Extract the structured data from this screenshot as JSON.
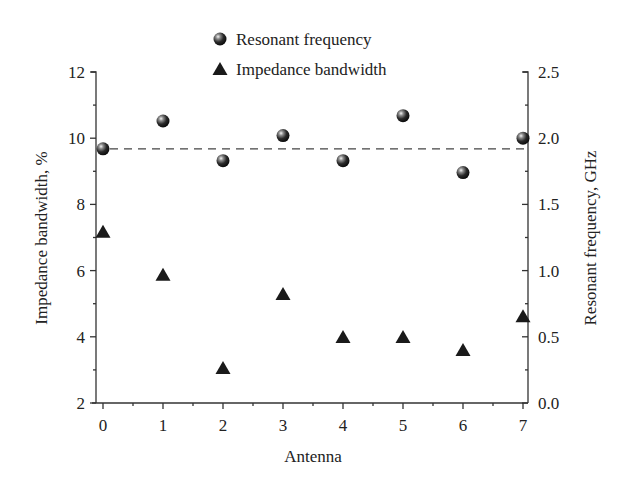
{
  "chart_data": {
    "type": "scatter",
    "title": "",
    "xlabel": "Antenna",
    "ylabel_left": "Impedance bandwidth, %",
    "ylabel_right": "Resonant frequency, GHz",
    "x": [
      0,
      1,
      2,
      3,
      4,
      5,
      6,
      7
    ],
    "xlim": [
      0,
      7
    ],
    "ylim_left": [
      2,
      12
    ],
    "ylim_right": [
      0.0,
      2.5
    ],
    "x_ticks": [
      "0",
      "1",
      "2",
      "3",
      "4",
      "5",
      "6",
      "7"
    ],
    "y_left_ticks": [
      "2",
      "4",
      "6",
      "8",
      "10",
      "12"
    ],
    "y_right_ticks": [
      "0.0",
      "0.5",
      "1.0",
      "1.5",
      "2.0",
      "2.5"
    ],
    "grid": false,
    "legend_position": "top-center",
    "series": [
      {
        "name": "Resonant frequency",
        "marker": "sphere",
        "axis": "right",
        "values": [
          1.92,
          2.13,
          1.83,
          2.02,
          1.83,
          2.17,
          1.74,
          2.0
        ]
      },
      {
        "name": "Impedance bandwidth",
        "marker": "triangle",
        "axis": "left",
        "values": [
          7.15,
          5.85,
          3.03,
          5.27,
          3.97,
          3.97,
          3.58,
          4.6
        ]
      }
    ],
    "reference_lines": [
      {
        "style": "dashed",
        "axis": "right",
        "value": 1.92,
        "label": ""
      }
    ]
  },
  "legend": {
    "items": [
      {
        "label": "Resonant frequency",
        "icon": "sphere-marker-icon"
      },
      {
        "label": "Impedance bandwidth",
        "icon": "triangle-marker-icon"
      }
    ]
  },
  "colors": {
    "axis": "#333333",
    "marker": "#1a1a1a",
    "dash": "#444444",
    "background": "#ffffff"
  }
}
